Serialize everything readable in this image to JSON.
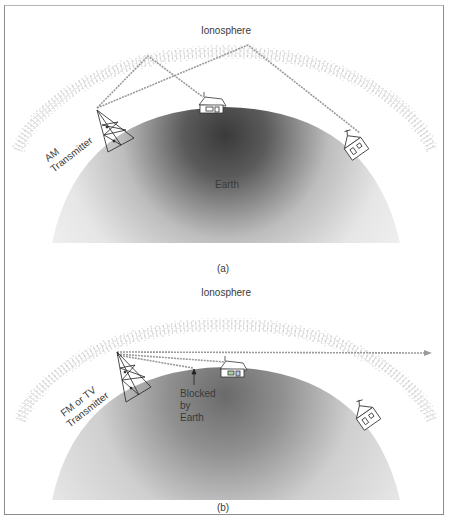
{
  "panels": [
    {
      "id": "a",
      "caption": "(a)",
      "ionosphere_label": "Ionosphere",
      "earth_label": "Earth",
      "transmitter_label_line1": "AM",
      "transmitter_label_line2": "Transmitter",
      "description": "AM waves reflect off the ionosphere and reach houses beyond the horizon"
    },
    {
      "id": "b",
      "caption": "(b)",
      "ionosphere_label": "Ionosphere",
      "transmitter_label_line1": "FM or TV",
      "transmitter_label_line2": "Transmitter",
      "blocked_label_line1": "Blocked",
      "blocked_label_line2": "by",
      "blocked_label_line3": "Earth",
      "description": "FM/TV waves pass through the ionosphere; line-of-sight only, blocked by Earth's curvature"
    }
  ],
  "colors": {
    "wave": "#9a9a9a",
    "earth_dark": "#3c3c3c",
    "earth_light": "#f2f2f2",
    "ionosphere_dots": "#b8b8b8",
    "text": "#3a3a3a",
    "frame": "#8c8c8c"
  }
}
